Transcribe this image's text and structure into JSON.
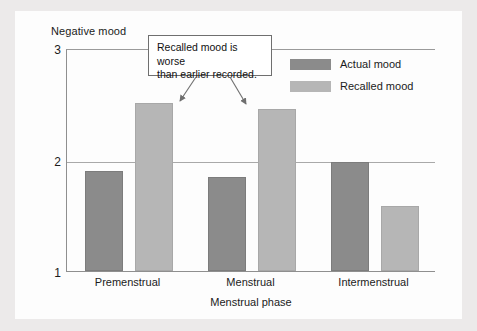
{
  "figure": {
    "background_color": "#ebeaea",
    "panel_color": "#fdfdfd"
  },
  "callout": {
    "text": "Recalled mood is worse\nthan earlier recorded.",
    "arrow_count": 2
  },
  "legend": {
    "items": [
      {
        "label": "Actual mood",
        "color": "#8b8b8b",
        "key": "actual"
      },
      {
        "label": "Recalled mood",
        "color": "#b6b6b6",
        "key": "recalled"
      }
    ]
  },
  "chart_data": {
    "type": "bar",
    "title": "",
    "ylabel": "Negative mood",
    "xlabel": "Menstrual phase",
    "categories": [
      "Premenstrual",
      "Menstrual",
      "Intermenstrual"
    ],
    "yticks": [
      "1",
      "2",
      "3"
    ],
    "ytick_values": [
      1,
      2,
      3
    ],
    "ylim": [
      1,
      3
    ],
    "grid": true,
    "legend_position": "top-right",
    "series": [
      {
        "name": "Actual mood",
        "color": "#8b8b8b",
        "values": [
          1.9,
          1.84,
          1.98
        ]
      },
      {
        "name": "Recalled mood",
        "color": "#b6b6b6",
        "values": [
          2.51,
          2.45,
          1.58
        ]
      }
    ]
  }
}
